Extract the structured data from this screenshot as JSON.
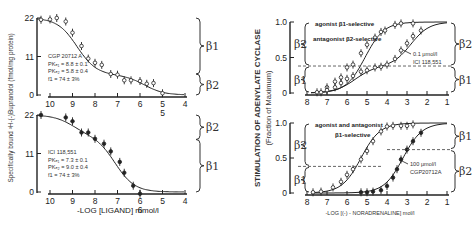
{
  "left_ylabel": "Specifically bound ³H-(-)Bupranolol (fmol/mg protein)",
  "left_xlabel": "-LOG [LIGAND] mmol/l",
  "right_ylabel": "STIMULATION OF ADENYLATE CYCLASE",
  "right_ylabel2": "(Fraction of Maximum)",
  "right_xlabel": "-LOG [(-) - NORADRENALINE] mol/l",
  "chart_data": [
    {
      "id": "binding-cgp",
      "type": "scatter",
      "title": "",
      "xlabel": "",
      "ylabel": "Specifically bound 3H-(-)Bupranolol (fmol/mg protein)",
      "xlim": [
        10,
        4
      ],
      "ylim": [
        0,
        22
      ],
      "x_ticks": [
        "10",
        "9",
        "8",
        "7",
        "6",
        "5",
        "4"
      ],
      "y_ticks": [
        "0",
        "11",
        "22"
      ],
      "legend": [
        "CGP 20712 A",
        "PK_D1 = 8.8 ± 0.1",
        "PK_D2 = 5.8 ± 0.4",
        "f1 = 74 ± 3%"
      ],
      "marker": "open",
      "points": [
        {
          "x": 10.4,
          "y": 21.5
        },
        {
          "x": 10.0,
          "y": 21.6
        },
        {
          "x": 9.7,
          "y": 22.0
        },
        {
          "x": 9.3,
          "y": 21.0
        },
        {
          "x": 9.0,
          "y": 17.8
        },
        {
          "x": 8.6,
          "y": 14.0
        },
        {
          "x": 8.3,
          "y": 10.4
        },
        {
          "x": 8.0,
          "y": 9.2
        },
        {
          "x": 7.7,
          "y": 8.6
        },
        {
          "x": 7.3,
          "y": 6.0
        },
        {
          "x": 7.0,
          "y": 5.8
        },
        {
          "x": 6.7,
          "y": 4.2
        },
        {
          "x": 6.4,
          "y": 4.2
        },
        {
          "x": 6.0,
          "y": 4.0
        },
        {
          "x": 5.7,
          "y": 3.2
        },
        {
          "x": 5.4,
          "y": 3.4
        },
        {
          "x": 5.0,
          "y": 0.5
        }
      ],
      "fit": {
        "f1": 0.74,
        "pK1": 8.8,
        "pK2": 5.8,
        "top": 22
      },
      "annotations": [
        {
          "label": "β1",
          "y_range": [
            6,
            22
          ],
          "side": "right"
        },
        {
          "label": "β2",
          "y_range": [
            0,
            6
          ],
          "side": "right"
        },
        {
          "label": "5",
          "at_x": 5
        }
      ]
    },
    {
      "id": "binding-ici",
      "type": "scatter",
      "xlabel": "-LOG [LIGAND] mmol/l",
      "ylabel": "",
      "xlim": [
        10,
        4
      ],
      "ylim": [
        0,
        22
      ],
      "x_ticks": [
        "10",
        "9",
        "8",
        "7",
        "6",
        "5",
        "4"
      ],
      "y_ticks": [
        "0",
        "11",
        "22"
      ],
      "legend": [
        "ICI 118,551",
        "PK_D1 = 7.3 ± 0.1",
        "PK_D2 = 9.0 ± 0.4",
        "f1 = 74 ± 3%"
      ],
      "marker": "filled",
      "points": [
        {
          "x": 10.4,
          "y": 22.0
        },
        {
          "x": 9.3,
          "y": 21.3
        },
        {
          "x": 9.0,
          "y": 20.2
        },
        {
          "x": 8.6,
          "y": 17.0
        },
        {
          "x": 8.3,
          "y": 17.0
        },
        {
          "x": 8.0,
          "y": 15.2
        },
        {
          "x": 7.6,
          "y": 13.8
        },
        {
          "x": 7.3,
          "y": 11.6
        },
        {
          "x": 6.9,
          "y": 8.6
        },
        {
          "x": 6.7,
          "y": 5.5
        },
        {
          "x": 6.3,
          "y": 1.8
        },
        {
          "x": 6.0,
          "y": -0.5
        }
      ],
      "fit": {
        "f1": 0.26,
        "pK1": 9.0,
        "pK2": 7.1,
        "top": 22
      },
      "annotations": [
        {
          "label": "β2",
          "y_range": [
            15,
            22
          ],
          "side": "right"
        },
        {
          "label": "β1",
          "y_range": [
            0,
            15
          ],
          "side": "right"
        },
        {
          "label": "6",
          "at_x": 6
        }
      ]
    },
    {
      "id": "cyclase-ici",
      "type": "line",
      "ylabel": "STIMULATION OF ADENYLATE CYCLASE (Fraction of Maximum)",
      "xlim": [
        8,
        1
      ],
      "ylim": [
        0,
        1.0
      ],
      "x_ticks": [
        "8",
        "7",
        "6",
        "5",
        "4",
        "3",
        "2",
        "1"
      ],
      "y_ticks": [
        "0",
        "0.5",
        "1.0"
      ],
      "legend": [
        "agonist β1-selective",
        "antagonist β2-selective"
      ],
      "annotation": "0.1 μmol/l ICI 118,551",
      "threshold": 0.38,
      "series": [
        {
          "name": "control",
          "marker": "open",
          "points": [
            [
              7.5,
              0.01
            ],
            [
              7.0,
              0.08
            ],
            [
              6.6,
              0.16
            ],
            [
              6.3,
              0.22
            ],
            [
              6.0,
              0.36
            ],
            [
              5.7,
              0.4
            ],
            [
              5.3,
              0.56
            ],
            [
              5.0,
              0.68
            ],
            [
              4.6,
              0.78
            ],
            [
              4.3,
              0.86
            ],
            [
              4.1,
              0.88
            ],
            [
              3.6,
              0.96
            ],
            [
              3.3,
              0.98
            ],
            [
              2.7,
              0.98
            ]
          ],
          "fit": {
            "ec50": 5.1,
            "slope": 0.75
          }
        },
        {
          "name": "0.1 μmol/l ICI 118,551",
          "marker": "open",
          "points": [
            [
              7.3,
              0.01
            ],
            [
              7.0,
              0.04
            ],
            [
              6.6,
              0.08
            ],
            [
              6.3,
              0.14
            ],
            [
              6.0,
              0.2
            ],
            [
              5.7,
              0.24
            ],
            [
              5.3,
              0.3
            ],
            [
              5.0,
              0.32
            ],
            [
              4.6,
              0.36
            ],
            [
              4.3,
              0.37
            ],
            [
              4.0,
              0.4
            ],
            [
              3.6,
              0.48
            ],
            [
              3.3,
              0.6
            ],
            [
              3.0,
              0.7
            ],
            [
              2.7,
              0.8
            ],
            [
              2.3,
              0.88
            ]
          ],
          "fit": {
            "biphasic": true,
            "f1": 0.38,
            "ec50a": 5.6,
            "ec50b": 2.8
          }
        }
      ],
      "annotations": [
        {
          "label": "β2",
          "y_range": [
            0.38,
            1.0
          ],
          "side": "left"
        },
        {
          "label": "β1",
          "y_range": [
            0,
            0.38
          ],
          "side": "left"
        },
        {
          "label": "β2",
          "y_range": [
            0.38,
            1.0
          ],
          "side": "right"
        },
        {
          "label": "β1",
          "y_range": [
            0,
            0.38
          ],
          "side": "right"
        }
      ]
    },
    {
      "id": "cyclase-cgp",
      "type": "line",
      "xlabel": "-LOG [(-) - NORADRENALINE] mol/l",
      "xlim": [
        8,
        1
      ],
      "ylim": [
        0,
        1.0
      ],
      "x_ticks": [
        "8",
        "7",
        "6",
        "5",
        "4",
        "3",
        "2",
        "1"
      ],
      "y_ticks": [
        "0",
        "0.5",
        "1.0"
      ],
      "legend": [
        "agonist and antagonist",
        "β1-selective"
      ],
      "annotation": "100 μmol/l CGP20712A",
      "threshold_left": 0.38,
      "threshold_right": 0.62,
      "series": [
        {
          "name": "control",
          "marker": "open",
          "points": [
            [
              7.7,
              0.01
            ],
            [
              7.3,
              0.02
            ],
            [
              6.7,
              0.08
            ],
            [
              6.3,
              0.16
            ],
            [
              6.0,
              0.26
            ],
            [
              5.7,
              0.34
            ],
            [
              5.3,
              0.48
            ],
            [
              5.0,
              0.6
            ],
            [
              4.7,
              0.74
            ],
            [
              4.3,
              0.88
            ],
            [
              4.0,
              0.95
            ],
            [
              3.7,
              0.96
            ],
            [
              3.3,
              0.96
            ],
            [
              3.0,
              0.96
            ],
            [
              2.7,
              0.98
            ]
          ],
          "fit": {
            "ec50": 5.3,
            "slope": 0.8
          }
        },
        {
          "name": "100 μmol/l CGP20712A",
          "marker": "filled",
          "points": [
            [
              5.3,
              0.01
            ],
            [
              5.0,
              0.01
            ],
            [
              4.7,
              0.02
            ],
            [
              4.3,
              0.04
            ],
            [
              4.0,
              0.1
            ],
            [
              3.7,
              0.22
            ],
            [
              3.5,
              0.34
            ],
            [
              3.3,
              0.48
            ],
            [
              3.0,
              0.62
            ],
            [
              2.7,
              0.74
            ],
            [
              2.3,
              0.86
            ]
          ],
          "fit": {
            "ec50": 3.2,
            "slope": 0.75
          }
        }
      ],
      "annotations": [
        {
          "label": "β2",
          "y_range": [
            0.38,
            1.0
          ],
          "side": "left"
        },
        {
          "label": "β1",
          "y_range": [
            0,
            0.38
          ],
          "side": "left"
        },
        {
          "label": "β1",
          "y_range": [
            0.62,
            1.0
          ],
          "side": "right"
        },
        {
          "label": "β2",
          "y_range": [
            0,
            0.62
          ],
          "side": "right"
        }
      ]
    }
  ]
}
